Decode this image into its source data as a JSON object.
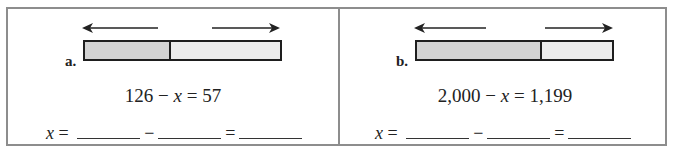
{
  "problems": [
    {
      "label": "a.",
      "equation": {
        "left": "126 − ",
        "variable": "x",
        "right": " = 57"
      },
      "tape_diagram": {
        "left_segment_fraction": 0.44,
        "left_arrow": "arrow-left-icon",
        "right_arrow": "arrow-right-icon"
      },
      "answer": {
        "variable": "x",
        "equals": " =",
        "minus": "−",
        "equals2": "=",
        "blanks": [
          "",
          "",
          ""
        ]
      }
    },
    {
      "label": "b.",
      "equation": {
        "left": "2,000 − ",
        "variable": "x",
        "right": " = 1,199"
      },
      "tape_diagram": {
        "left_segment_fraction": 0.64,
        "left_arrow": "arrow-left-icon",
        "right_arrow": "arrow-right-icon"
      },
      "answer": {
        "variable": "x",
        "equals": " =",
        "minus": "−",
        "equals2": "=",
        "blanks": [
          "",
          "",
          ""
        ]
      }
    }
  ],
  "colors": {
    "border": "#8d8d8d",
    "bar_outline": "#1e1e1e",
    "segment_dark": "#d3d3d3",
    "segment_light": "#ececec"
  }
}
